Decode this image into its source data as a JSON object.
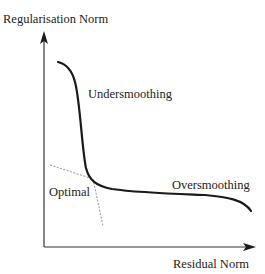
{
  "diagram": {
    "type": "L-curve",
    "y_axis_label": "Regularisation Norm",
    "x_axis_label": "Residual Norm",
    "annotations": {
      "undersmoothing": "Undersmoothing",
      "oversmoothing": "Oversmoothing",
      "optimal": "Optimal"
    },
    "colors": {
      "curve": "#1a1a1a",
      "axis": "#333333",
      "tangent": "#888888",
      "text": "#222222"
    }
  }
}
